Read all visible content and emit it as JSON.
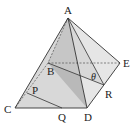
{
  "diagram": {
    "type": "square pyramid with cross sections",
    "labels": {
      "A": "A",
      "B": "B",
      "C": "C",
      "D": "D",
      "E": "E",
      "P": "P",
      "Q": "Q",
      "R": "R",
      "theta": "θ"
    },
    "colors": {
      "edge": "#333333",
      "face_dark": "#b8b8b8",
      "face_mid": "#d4d4d4",
      "face_light": "#e8e8e8",
      "base": "#f0f0f0",
      "hidden": "#555555"
    }
  }
}
